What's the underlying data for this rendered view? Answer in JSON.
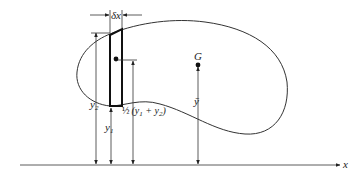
{
  "diagram": {
    "type": "centroid-of-area",
    "colors": {
      "stroke": "#333333",
      "background": "#ffffff"
    },
    "labels": {
      "delta_x": "δx",
      "centroid": "G",
      "y_bar": "ȳ",
      "y2_main": "y",
      "y2_sub": "2",
      "y1_main": "y",
      "y1_sub": "1",
      "half_mean_prefix": "½",
      "half_mean_open": "(y",
      "half_mean_sub1": "1",
      "half_mean_plus": " + y",
      "half_mean_sub2": "2",
      "half_mean_close": ")",
      "x_axis": "x"
    }
  }
}
